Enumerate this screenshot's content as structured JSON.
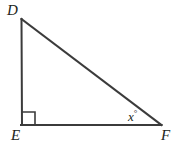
{
  "figure": {
    "type": "right-triangle-diagram",
    "stroke_color": "#3b3b3b",
    "text_color": "#231f20",
    "background_color": "#ffffff",
    "vertices": {
      "D": {
        "label": "D",
        "x": 21,
        "y": 19
      },
      "E": {
        "label": "E",
        "x": 22,
        "y": 125
      },
      "F": {
        "label": "F",
        "x": 161,
        "y": 125
      }
    },
    "angles": {
      "at_E": {
        "marker": "right-angle-square",
        "measure_label": ""
      },
      "at_F": {
        "marker": "angle-label",
        "variable": "x",
        "degree_symbol": "°"
      }
    },
    "labels": {
      "vertex_D": "D",
      "vertex_E": "E",
      "vertex_F": "F",
      "angle_x_variable": "x",
      "angle_x_degree": "°"
    }
  }
}
